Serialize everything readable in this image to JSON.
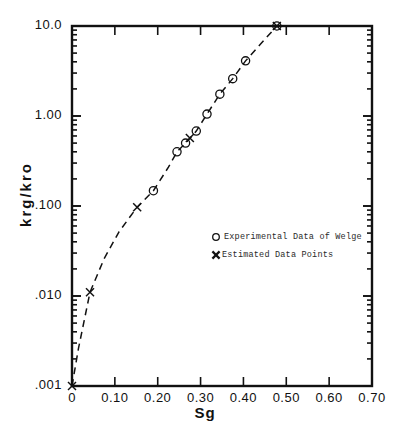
{
  "chart_data": {
    "type": "scatter",
    "title": "",
    "xlabel": "Sg",
    "ylabel": "krg/kro",
    "yscale": "log",
    "xscale": "linear",
    "xlim": [
      0.0,
      0.7
    ],
    "ylim": [
      0.001,
      10.0
    ],
    "grid": false,
    "legend_position": "center-right-inside",
    "xticks": [
      "0",
      "0.10",
      "0.20",
      "0.30",
      "0.40",
      "0.50",
      "0.60",
      "0.70"
    ],
    "xtick_values": [
      0.0,
      0.1,
      0.2,
      0.3,
      0.4,
      0.5,
      0.6,
      0.7
    ],
    "yticks": [
      "10.0",
      "1.00",
      ".100",
      ".010",
      ".001"
    ],
    "ytick_values": [
      10.0,
      1.0,
      0.1,
      0.01,
      0.001
    ],
    "series": [
      {
        "name": "Experimental Data of Welge",
        "marker": "open-circle",
        "points": [
          {
            "x": 0.19,
            "y": 0.148
          },
          {
            "x": 0.245,
            "y": 0.4
          },
          {
            "x": 0.265,
            "y": 0.5
          },
          {
            "x": 0.29,
            "y": 0.68
          },
          {
            "x": 0.315,
            "y": 1.05
          },
          {
            "x": 0.345,
            "y": 1.75
          },
          {
            "x": 0.375,
            "y": 2.6
          },
          {
            "x": 0.405,
            "y": 4.1
          },
          {
            "x": 0.478,
            "y": 10.0
          }
        ]
      },
      {
        "name": "Estimated Data Points",
        "marker": "cross",
        "points": [
          {
            "x": 0.0,
            "y": 0.001
          },
          {
            "x": 0.042,
            "y": 0.011
          },
          {
            "x": 0.152,
            "y": 0.097
          },
          {
            "x": 0.275,
            "y": 0.57
          },
          {
            "x": 0.478,
            "y": 10.0
          }
        ]
      }
    ],
    "curve": {
      "style": "dashed",
      "points": [
        {
          "x": 0.0,
          "y": 0.001
        },
        {
          "x": 0.015,
          "y": 0.0026
        },
        {
          "x": 0.042,
          "y": 0.011
        },
        {
          "x": 0.075,
          "y": 0.026
        },
        {
          "x": 0.11,
          "y": 0.052
        },
        {
          "x": 0.152,
          "y": 0.097
        },
        {
          "x": 0.19,
          "y": 0.148
        },
        {
          "x": 0.225,
          "y": 0.27
        },
        {
          "x": 0.245,
          "y": 0.4
        },
        {
          "x": 0.265,
          "y": 0.5
        },
        {
          "x": 0.29,
          "y": 0.68
        },
        {
          "x": 0.315,
          "y": 1.05
        },
        {
          "x": 0.345,
          "y": 1.75
        },
        {
          "x": 0.375,
          "y": 2.6
        },
        {
          "x": 0.405,
          "y": 4.1
        },
        {
          "x": 0.44,
          "y": 6.3
        },
        {
          "x": 0.478,
          "y": 10.0
        }
      ]
    },
    "legend": [
      {
        "marker": "open-circle",
        "label": "Experimental Data of Welge"
      },
      {
        "marker": "cross",
        "label": "Estimated Data Points"
      }
    ]
  },
  "axes": {
    "x_title": "Sg",
    "y_title": "krg/kro",
    "x_tick_labels": [
      "0",
      "0.10",
      "0.20",
      "0.30",
      "0.40",
      "0.50",
      "0.60",
      "0.70"
    ],
    "y_tick_labels": [
      "10.0",
      "1.00",
      ".100",
      ".010",
      ".001"
    ]
  },
  "legend": {
    "entry_0_label": "Experimental Data of Welge",
    "entry_1_label": "Estimated Data Points"
  }
}
